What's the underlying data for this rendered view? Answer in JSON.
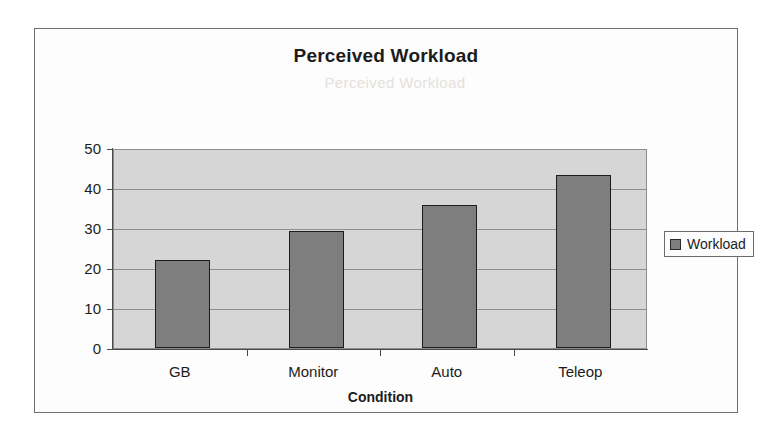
{
  "chart_data": {
    "type": "bar",
    "title": "Perceived Workload",
    "xlabel": "Condition",
    "ylabel": "",
    "categories": [
      "GB",
      "Monitor",
      "Auto",
      "Teleop"
    ],
    "values": [
      22.1,
      29.3,
      35.8,
      43.3
    ],
    "series": [
      {
        "name": "Workload",
        "values": [
          22.1,
          29.3,
          35.8,
          43.3
        ]
      }
    ],
    "ylim": [
      0,
      50
    ],
    "ytick_labels": [
      "50",
      "40",
      "30",
      "20",
      "10",
      "0"
    ],
    "ytick_values": [
      50,
      40,
      30,
      20,
      10,
      0
    ],
    "grid": true,
    "legend": {
      "position": "right",
      "entries": [
        "Workload"
      ]
    },
    "colors": {
      "bar_fill": "#7e7e7e",
      "bar_outline": "#1c1c1c",
      "plot_background": "#d6d6d6",
      "gridline": "#8f8f8f",
      "frame": "#6f6f6f",
      "text": "#1c1c1c"
    },
    "ghost_text": "Perceived Workload"
  }
}
